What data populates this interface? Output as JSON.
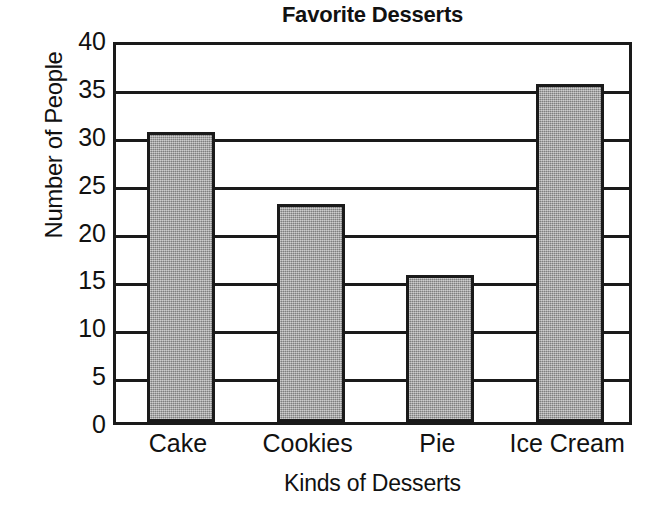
{
  "chart_data": {
    "type": "bar",
    "title": "Favorite Desserts",
    "xlabel": "Kinds of Desserts",
    "ylabel": "Number of People",
    "categories": [
      "Cake",
      "Cookies",
      "Pie",
      "Ice Cream"
    ],
    "values": [
      30,
      22.5,
      15,
      35
    ],
    "ylim": [
      0,
      40
    ],
    "ytick_values": [
      0,
      5,
      10,
      15,
      20,
      25,
      30,
      35,
      40
    ],
    "ytick_labels": [
      "0",
      "5",
      "10",
      "15",
      "20",
      "25",
      "30",
      "35",
      "40"
    ],
    "ytick_step": 5,
    "grid": true,
    "grid_axis": "y",
    "legend": false,
    "legend_position": "none",
    "bar_fill_color": "#9d9d9d",
    "bar_edge_color": "#1a1a1a",
    "axis_color": "#1a1a1a",
    "background_color": "#ffffff",
    "text_color": "#111111"
  }
}
